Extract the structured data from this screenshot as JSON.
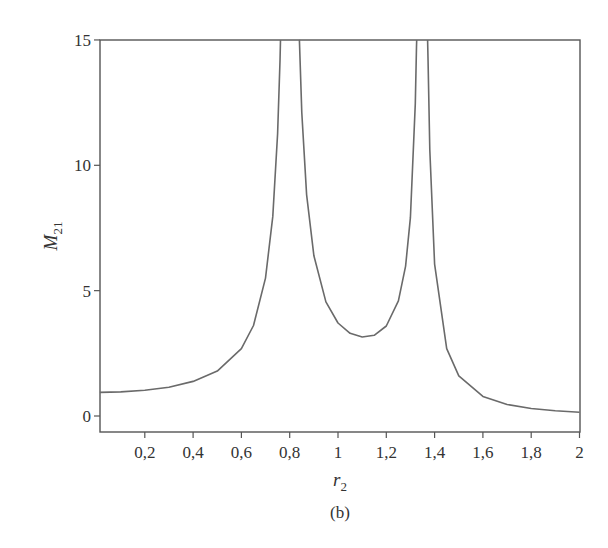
{
  "figure": {
    "caption": "(b)"
  },
  "chart_data": {
    "type": "line",
    "title": "",
    "xlabel": "r",
    "xlabel_sub": "2",
    "ylabel": "M",
    "ylabel_sub": "21",
    "xlim": [
      0.014,
      2.0
    ],
    "ylim": [
      -0.6,
      15
    ],
    "grid": false,
    "legend": null,
    "x_ticks": [
      {
        "value": 0.2,
        "label": "0,2"
      },
      {
        "value": 0.4,
        "label": "0,4"
      },
      {
        "value": 0.6,
        "label": "0,6"
      },
      {
        "value": 0.8,
        "label": "0,8"
      },
      {
        "value": 1.0,
        "label": "1"
      },
      {
        "value": 1.2,
        "label": "1,2"
      },
      {
        "value": 1.4,
        "label": "1,4"
      },
      {
        "value": 1.6,
        "label": "1,6"
      },
      {
        "value": 1.8,
        "label": "1,8"
      },
      {
        "value": 2.0,
        "label": "2"
      }
    ],
    "y_ticks": [
      {
        "value": 0,
        "label": "0"
      },
      {
        "value": 5,
        "label": "5"
      },
      {
        "value": 10,
        "label": "10"
      },
      {
        "value": 15,
        "label": "15"
      }
    ],
    "series": [
      {
        "name": "M21",
        "segments": [
          {
            "x": [
              0.014,
              0.1,
              0.2,
              0.3,
              0.4,
              0.5,
              0.6,
              0.65,
              0.7,
              0.73,
              0.75,
              0.76,
              0.762
            ],
            "y": [
              0.94,
              0.96,
              1.03,
              1.15,
              1.38,
              1.79,
              2.69,
              3.61,
              5.5,
              7.96,
              11.26,
              14.16,
              15
            ]
          },
          {
            "x": [
              0.84,
              0.85,
              0.87,
              0.9,
              0.95,
              1.0,
              1.05,
              1.1,
              1.15,
              1.2,
              1.25,
              1.28,
              1.3,
              1.32,
              1.325,
              1.326
            ],
            "y": [
              15,
              12.1,
              8.83,
              6.39,
              4.55,
              3.71,
              3.3,
              3.15,
              3.22,
              3.59,
              4.59,
              5.98,
              7.91,
              12.46,
              14.74,
              15
            ]
          },
          {
            "x": [
              1.371,
              1.373,
              1.38,
              1.4,
              1.45,
              1.5,
              1.6,
              1.7,
              1.8,
              1.9,
              2.0
            ],
            "y": [
              15,
              14.1,
              10.62,
              6.06,
              2.69,
              1.6,
              0.78,
              0.46,
              0.3,
              0.21,
              0.15
            ]
          }
        ],
        "color": "#6a6a6a"
      }
    ],
    "annotations": [
      {
        "text": "(b)",
        "position": "below-x-label"
      }
    ]
  },
  "layout": {
    "plot_left": 100,
    "plot_right": 580,
    "plot_top": 40,
    "plot_bottom": 432,
    "x0_px": 96.5,
    "px_per_x": 241.5,
    "y0_px": 416,
    "px_per_y": 25.07
  }
}
